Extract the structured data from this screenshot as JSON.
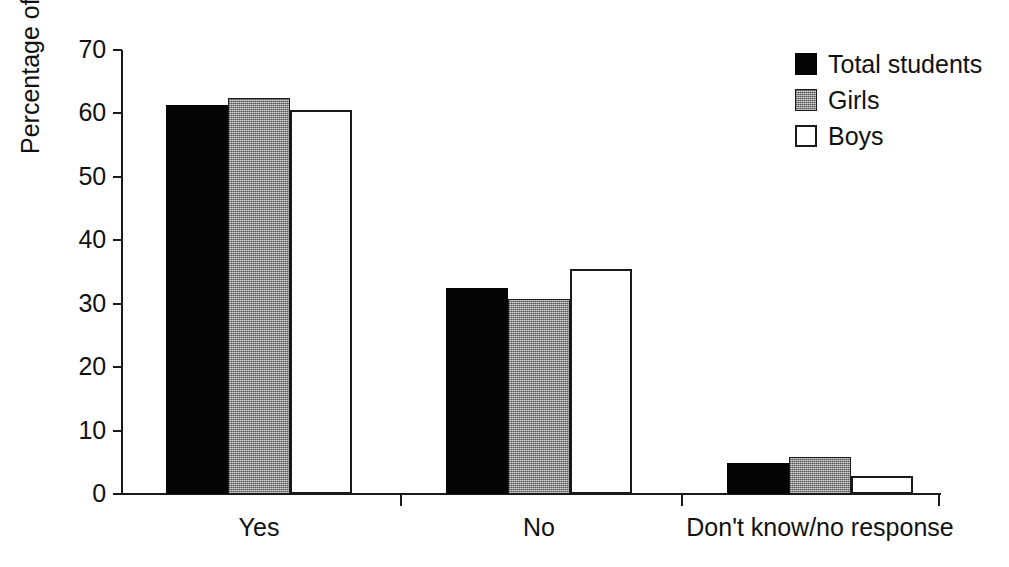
{
  "chart_data": {
    "type": "bar",
    "title": "",
    "xlabel": "",
    "ylabel": "Percentage of respondents",
    "ylim": [
      0,
      70
    ],
    "ytick_labels": [
      "70",
      "60",
      "50",
      "40",
      "30",
      "20",
      "10",
      "0"
    ],
    "ytick_values": [
      70,
      60,
      50,
      40,
      30,
      20,
      10,
      0
    ],
    "grid": false,
    "legend_position": "top-right",
    "categories": [
      "Yes",
      "No",
      "Don't know/no response"
    ],
    "series": [
      {
        "name": "Total students",
        "color": "#050505",
        "fill": "solid-black",
        "values": [
          61.4,
          32.5,
          4.9
        ]
      },
      {
        "name": "Girls",
        "color": "#8a8a8a",
        "fill": "dithered-gray",
        "values": [
          62.4,
          30.8,
          5.8
        ]
      },
      {
        "name": "Boys",
        "color": "#ffffff",
        "fill": "white-outlined",
        "values": [
          60.6,
          35.4,
          2.8
        ]
      }
    ]
  },
  "axis": {
    "y_title": "Percentage of respondents"
  },
  "legend": {
    "entries": [
      {
        "label": "Total students"
      },
      {
        "label": "Girls"
      },
      {
        "label": "Boys"
      }
    ]
  }
}
